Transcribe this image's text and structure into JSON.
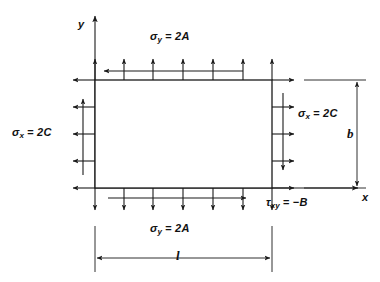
{
  "figure": {
    "type": "stress-element-diagram",
    "background_color": "#ffffff",
    "line_color": "#1a1a1a"
  },
  "axes": {
    "y_label": "y",
    "x_label": "x",
    "origin_x": 95,
    "origin_y": 188
  },
  "plate": {
    "left": 95,
    "top": 80,
    "right": 272,
    "bottom": 188,
    "width": 177,
    "height": 108
  },
  "labels": {
    "sigma_y_top": {
      "symbol": "σ",
      "subscript": "y",
      "equals": "=",
      "value": "2A"
    },
    "sigma_y_bottom": {
      "symbol": "σ",
      "subscript": "y",
      "equals": "=",
      "value": "2A"
    },
    "sigma_x_left": {
      "symbol": "σ",
      "subscript": "x",
      "equals": "=",
      "value": "2C"
    },
    "sigma_x_right": {
      "symbol": "σ",
      "subscript": "x",
      "equals": "=",
      "value": "2C"
    },
    "tau_xy": {
      "symbol": "τ",
      "subscript": "xy",
      "equals": "=",
      "value": "−B"
    }
  },
  "dimensions": {
    "length": {
      "label": "l",
      "axis": "horizontal",
      "position": "bottom"
    },
    "height": {
      "label": "b",
      "axis": "vertical",
      "position": "right"
    }
  },
  "stress_arrows": {
    "top_normal": {
      "count": 7,
      "direction": "up",
      "meaning": "sigma-y tension"
    },
    "bottom_normal": {
      "count": 7,
      "direction": "down",
      "meaning": "sigma-y tension"
    },
    "left_normal": {
      "count": 5,
      "direction": "left",
      "meaning": "sigma-x tension"
    },
    "right_normal": {
      "count": 5,
      "direction": "right",
      "meaning": "sigma-x tension"
    },
    "top_shear": {
      "direction": "left",
      "meaning": "tau-xy negative"
    },
    "bottom_shear": {
      "direction": "right",
      "meaning": "tau-xy negative"
    },
    "left_shear": {
      "direction": "up",
      "meaning": "tau-xy negative"
    },
    "right_shear": {
      "direction": "down",
      "meaning": "tau-xy negative"
    }
  }
}
